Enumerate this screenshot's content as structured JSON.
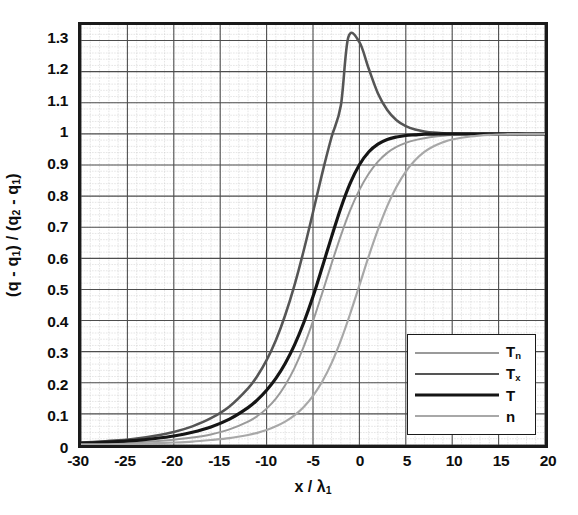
{
  "chart_data": {
    "type": "line",
    "title": "",
    "xlabel": "x / λ₁",
    "ylabel": "(q - q₁) / (q₂ - q₁)",
    "xlim": [
      -30,
      20
    ],
    "ylim": [
      0,
      1.35
    ],
    "grid": true,
    "grid_major_x": 5,
    "grid_major_y": 0.1,
    "grid_minor_x": 1,
    "grid_minor_y": 0.02,
    "legend_position": "lower-right-inside",
    "xticks": [
      -30,
      -25,
      -20,
      -15,
      -10,
      -5,
      0,
      5,
      10,
      15,
      20
    ],
    "xtick_labels": [
      "-30",
      "-25",
      "-20",
      "-15",
      "-10",
      "-5",
      "0",
      "5",
      "10",
      "15",
      "20"
    ],
    "yticks": [
      0,
      0.1,
      0.2,
      0.3,
      0.4,
      0.5,
      0.6,
      0.7,
      0.8,
      0.9,
      1,
      1.1,
      1.2,
      1.3
    ],
    "ytick_labels": [
      "0",
      "0.1",
      "0.2",
      "0.3",
      "0.4",
      "0.5",
      "0.6",
      "0.7",
      "0.8",
      "0.9",
      "1",
      "1.1",
      "1.2",
      "1.3"
    ],
    "series": [
      {
        "name": "T_n",
        "legend_label": "T",
        "legend_sub": "n",
        "color": "#9a9a9a",
        "width": 2.0,
        "x": [
          -30,
          -28,
          -26,
          -24,
          -22,
          -20,
          -18,
          -16,
          -14,
          -12,
          -11,
          -10,
          -9,
          -8,
          -7,
          -6,
          -5,
          -4,
          -3,
          -2,
          -1,
          0,
          1,
          2,
          3,
          4,
          5,
          6,
          7,
          8,
          9,
          10,
          12,
          14,
          16,
          18,
          20
        ],
        "y": [
          0.004,
          0.005,
          0.007,
          0.009,
          0.012,
          0.017,
          0.024,
          0.034,
          0.05,
          0.075,
          0.093,
          0.117,
          0.149,
          0.192,
          0.247,
          0.316,
          0.398,
          0.489,
          0.583,
          0.673,
          0.754,
          0.82,
          0.872,
          0.911,
          0.939,
          0.958,
          0.971,
          0.98,
          0.986,
          0.991,
          0.994,
          0.996,
          0.998,
          0.999,
          1.0,
          1.0,
          1.0
        ]
      },
      {
        "name": "T_x",
        "legend_label": "T",
        "legend_sub": "x",
        "color": "#555555",
        "width": 2.6,
        "x": [
          -30,
          -28,
          -26,
          -24,
          -22,
          -20,
          -18,
          -16,
          -14,
          -12,
          -11,
          -10,
          -9,
          -8,
          -7,
          -6,
          -5,
          -4,
          -3,
          -2,
          -1.2,
          0,
          1,
          2,
          3,
          4,
          5,
          6,
          7,
          8,
          9,
          10,
          12,
          14,
          16,
          18,
          20
        ],
        "y": [
          0.008,
          0.011,
          0.015,
          0.021,
          0.03,
          0.042,
          0.06,
          0.086,
          0.124,
          0.182,
          0.222,
          0.273,
          0.337,
          0.417,
          0.513,
          0.625,
          0.748,
          0.874,
          0.99,
          1.091,
          1.31,
          1.295,
          1.21,
          1.13,
          1.077,
          1.044,
          1.025,
          1.014,
          1.008,
          1.004,
          1.002,
          1.001,
          1.0,
          1.0,
          1.0,
          1.0,
          1.0
        ]
      },
      {
        "name": "T",
        "legend_label": "T",
        "legend_sub": "",
        "color": "#151515",
        "width": 3.2,
        "x": [
          -30,
          -28,
          -26,
          -24,
          -22,
          -20,
          -18,
          -16,
          -14,
          -12,
          -11,
          -10,
          -9,
          -8,
          -7,
          -6,
          -5,
          -4,
          -3,
          -2,
          -1,
          0,
          1,
          2,
          3,
          4,
          5,
          6,
          7,
          8,
          9,
          10,
          12,
          14,
          16,
          18,
          20
        ],
        "y": [
          0.006,
          0.008,
          0.011,
          0.015,
          0.021,
          0.029,
          0.041,
          0.058,
          0.083,
          0.12,
          0.145,
          0.176,
          0.214,
          0.262,
          0.321,
          0.393,
          0.477,
          0.572,
          0.669,
          0.762,
          0.841,
          0.901,
          0.942,
          0.967,
          0.982,
          0.99,
          0.995,
          0.997,
          0.999,
          0.999,
          1.0,
          1.0,
          1.0,
          1.0,
          1.0,
          1.0,
          1.0
        ]
      },
      {
        "name": "n",
        "legend_label": "n",
        "legend_sub": "",
        "color": "#a8a8a8",
        "width": 2.2,
        "x": [
          -30,
          -28,
          -26,
          -24,
          -22,
          -20,
          -18,
          -16,
          -14,
          -12,
          -11,
          -10,
          -9,
          -8,
          -7,
          -6,
          -5,
          -4,
          -3,
          -2,
          -1,
          0,
          1,
          2,
          3,
          4,
          5,
          6,
          7,
          8,
          9,
          10,
          12,
          14,
          16,
          18,
          20
        ],
        "y": [
          0.002,
          0.002,
          0.003,
          0.004,
          0.006,
          0.008,
          0.011,
          0.016,
          0.022,
          0.032,
          0.039,
          0.048,
          0.06,
          0.075,
          0.095,
          0.122,
          0.158,
          0.204,
          0.263,
          0.336,
          0.421,
          0.513,
          0.606,
          0.692,
          0.768,
          0.83,
          0.879,
          0.915,
          0.942,
          0.96,
          0.973,
          0.982,
          0.992,
          0.997,
          0.999,
          1.0,
          1.0
        ]
      }
    ]
  },
  "legend": {
    "items": [
      {
        "label": "T",
        "sub": "n"
      },
      {
        "label": "T",
        "sub": "x"
      },
      {
        "label": "T",
        "sub": ""
      },
      {
        "label": "n",
        "sub": ""
      }
    ]
  },
  "axes": {
    "y_title_main": "(q - q",
    "y_title_sub1": "1",
    "y_title_mid": ") / (q",
    "y_title_sub2": "2",
    "y_title_mid2": " - q",
    "y_title_sub3": "1",
    "y_title_end": ")",
    "x_title_main": "x / λ",
    "x_title_sub": "1"
  }
}
